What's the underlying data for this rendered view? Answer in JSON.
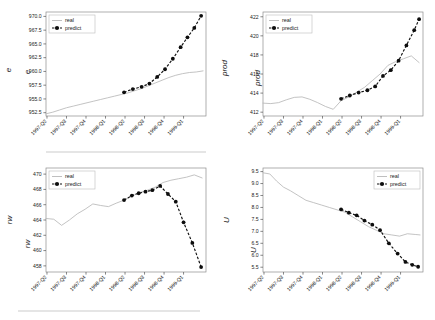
{
  "figure": {
    "title": "",
    "background": "#ffffff",
    "series_colors": {
      "real": "#b8b8b8",
      "predict": "#111111"
    },
    "legend_entries": {
      "real": "real",
      "predict": "predict"
    },
    "xticklabels": [
      "1997-Q2",
      "1997-Q3",
      "1997-Q4",
      "1998-Q1",
      "1998-Q2",
      "1998-Q3",
      "1998-Q4",
      "1999-Q1"
    ]
  },
  "chart_data": [
    {
      "id": "panel-e",
      "type": "line",
      "title": "",
      "xlabel": "",
      "ylabel": "e",
      "ghost_label": "e",
      "legend_position": "upper left",
      "grid": false,
      "x": [
        "1997-Q2",
        "1997-Q3",
        "1997-Q4",
        "1998-Q1",
        "1998-Q2",
        "1998-Q3",
        "1998-Q4",
        "1999-Q1"
      ],
      "xlim": [
        0,
        8.2
      ],
      "ylim": [
        951.9,
        970.8
      ],
      "yticks": [
        952.5,
        955.0,
        957.5,
        960.0,
        962.5,
        965.0,
        967.5,
        970.0
      ],
      "yticklabels": [
        "952.5",
        "955.0",
        "957.5",
        "960.0",
        "962.5",
        "965.0",
        "967.5",
        "970.0"
      ],
      "series": [
        {
          "name": "real",
          "x": [
            0.0,
            0.35,
            0.7,
            1.05,
            1.4,
            1.75,
            2.1,
            2.45,
            2.8,
            3.15,
            3.5,
            3.85,
            4.2,
            4.55,
            4.9,
            5.25,
            5.6,
            5.95,
            6.3,
            6.65,
            7.0,
            7.35,
            7.7,
            8.05
          ],
          "values": [
            952.3,
            952.6,
            953.0,
            953.4,
            953.7,
            954.0,
            954.3,
            954.6,
            954.9,
            955.2,
            955.5,
            955.8,
            956.1,
            956.5,
            956.9,
            957.4,
            957.9,
            958.4,
            958.9,
            959.3,
            959.6,
            959.8,
            959.9,
            960.1
          ]
        },
        {
          "name": "predict",
          "x": [
            4.0,
            4.45,
            4.9,
            5.3,
            5.7,
            6.1,
            6.5,
            6.9,
            7.25,
            7.6,
            7.95
          ],
          "values": [
            956.2,
            956.8,
            957.2,
            957.8,
            959.0,
            960.4,
            962.3,
            964.4,
            966.2,
            967.9,
            970.1
          ]
        }
      ]
    },
    {
      "id": "panel-prod",
      "type": "line",
      "title": "",
      "xlabel": "",
      "ylabel": "prod",
      "ghost_label": "prod",
      "legend_position": "upper left",
      "grid": false,
      "x": [
        "1997-Q2",
        "1997-Q3",
        "1997-Q4",
        "1998-Q1",
        "1998-Q2",
        "1998-Q3",
        "1998-Q4",
        "1999-Q1"
      ],
      "xlim": [
        0,
        8.2
      ],
      "ylim": [
        411.6,
        422.5
      ],
      "yticks": [
        412,
        414,
        416,
        418,
        420,
        422
      ],
      "yticklabels": [
        "412",
        "414",
        "416",
        "418",
        "420",
        "422"
      ],
      "series": [
        {
          "name": "real",
          "x": [
            0.0,
            0.4,
            0.8,
            1.2,
            1.6,
            2.0,
            2.4,
            2.8,
            3.2,
            3.6,
            4.0,
            4.4,
            4.8,
            5.2,
            5.6,
            6.0,
            6.4,
            6.8,
            7.2,
            7.6,
            8.0
          ],
          "values": [
            412.95,
            412.9,
            413.0,
            413.3,
            413.55,
            413.6,
            413.35,
            413.0,
            412.6,
            412.3,
            413.2,
            413.6,
            414.1,
            414.6,
            415.3,
            416.0,
            416.9,
            417.3,
            417.6,
            417.9,
            417.2
          ]
        },
        {
          "name": "predict",
          "x": [
            4.0,
            4.45,
            4.9,
            5.35,
            5.75,
            6.15,
            6.55,
            6.95,
            7.35,
            7.75,
            8.0
          ],
          "values": [
            413.4,
            413.75,
            414.05,
            414.3,
            414.7,
            415.8,
            416.4,
            417.4,
            419.0,
            420.6,
            421.75
          ]
        }
      ]
    },
    {
      "id": "panel-rw",
      "type": "line",
      "title": "",
      "xlabel": "",
      "ylabel": "rw",
      "ghost_label": "rw",
      "legend_position": "upper left",
      "grid": false,
      "x": [
        "1997-Q2",
        "1997-Q3",
        "1997-Q4",
        "1998-Q1",
        "1998-Q2",
        "1998-Q3",
        "1998-Q4",
        "1999-Q1"
      ],
      "xlim": [
        0,
        8.2
      ],
      "ylim": [
        457.2,
        470.8
      ],
      "yticks": [
        458,
        460,
        462,
        464,
        466,
        468,
        470
      ],
      "yticklabels": [
        "458",
        "460",
        "462",
        "464",
        "466",
        "468",
        "470"
      ],
      "series": [
        {
          "name": "real",
          "x": [
            0.0,
            0.4,
            0.8,
            1.2,
            1.6,
            2.0,
            2.4,
            2.8,
            3.2,
            3.6,
            4.0,
            4.4,
            4.8,
            5.2,
            5.6,
            6.0,
            6.4,
            6.8,
            7.2,
            7.6,
            8.0
          ],
          "values": [
            464.2,
            464.1,
            463.3,
            464.0,
            464.8,
            465.4,
            466.1,
            465.9,
            465.75,
            466.2,
            466.6,
            467.1,
            467.6,
            467.9,
            468.3,
            468.9,
            469.2,
            469.4,
            469.6,
            469.9,
            469.5
          ]
        },
        {
          "name": "predict",
          "x": [
            4.0,
            4.4,
            4.75,
            5.1,
            5.45,
            5.85,
            6.25,
            6.65,
            7.05,
            7.5,
            7.95
          ],
          "values": [
            466.6,
            467.2,
            467.5,
            467.7,
            467.9,
            468.45,
            467.4,
            466.4,
            463.7,
            461.0,
            457.85
          ]
        }
      ]
    },
    {
      "id": "panel-U",
      "type": "line",
      "title": "",
      "xlabel": "",
      "ylabel": "U",
      "ghost_label": "U",
      "legend_position": "upper right",
      "grid": false,
      "x": [
        "1997-Q2",
        "1997-Q3",
        "1997-Q4",
        "1998-Q1",
        "1998-Q2",
        "1998-Q3",
        "1998-Q4",
        "1999-Q1"
      ],
      "xlim": [
        0,
        8.2
      ],
      "ylim": [
        5.3,
        9.65
      ],
      "yticks": [
        5.5,
        6.0,
        6.5,
        7.0,
        7.5,
        8.0,
        8.5,
        9.0,
        9.5
      ],
      "yticklabels": [
        "5.5",
        "6.0",
        "6.5",
        "7.0",
        "7.5",
        "8.0",
        "8.5",
        "9.0",
        "9.5"
      ],
      "series": [
        {
          "name": "real",
          "x": [
            0.0,
            0.35,
            0.7,
            1.05,
            1.4,
            1.8,
            2.2,
            2.6,
            3.0,
            3.4,
            3.8,
            4.2,
            4.6,
            5.0,
            5.4,
            5.8,
            6.2,
            6.6,
            7.0,
            7.4,
            7.8,
            8.05
          ],
          "values": [
            9.45,
            9.4,
            9.1,
            8.85,
            8.7,
            8.5,
            8.3,
            8.2,
            8.1,
            8.0,
            7.9,
            7.8,
            7.6,
            7.4,
            7.2,
            7.05,
            6.9,
            6.85,
            6.8,
            6.9,
            6.87,
            6.85
          ]
        },
        {
          "name": "predict",
          "x": [
            4.0,
            4.4,
            4.8,
            5.2,
            5.6,
            6.0,
            6.45,
            6.9,
            7.3,
            7.65,
            7.95
          ],
          "values": [
            7.92,
            7.78,
            7.67,
            7.45,
            7.28,
            7.05,
            6.5,
            6.07,
            5.72,
            5.6,
            5.52
          ]
        }
      ]
    }
  ]
}
